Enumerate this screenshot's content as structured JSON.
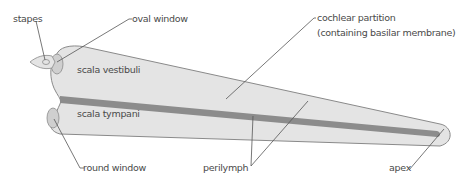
{
  "diagram": {
    "type": "anatomical-diagram",
    "colors": {
      "fluid_fill": "#e4e4e4",
      "outline": "#8a8a8a",
      "partition": "#8c8c8c",
      "window_fill": "#cfcfcf",
      "text": "#4a4a4a",
      "leader_line": "#555555"
    },
    "labels": {
      "stapes": "stapes",
      "oval_window": "oval window",
      "cochlear_partition_line1": "cochlear partition",
      "cochlear_partition_line2": "(containing basilar membrane)",
      "scala_vestibuli": "scala vestibuli",
      "scala_tympani": "scala tympani",
      "round_window": "round window",
      "perilymph": "perilymph",
      "apex": "apex"
    }
  }
}
